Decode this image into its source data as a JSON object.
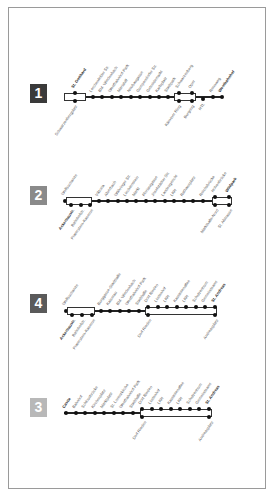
{
  "diagram": {
    "type": "route-line-diagram",
    "lines": [
      {
        "number": "1",
        "badge_color": "#3a3a3a",
        "terminus_start": "St. Gotthard",
        "terminus_end": "Westbahnhof",
        "stops_above": [
          "St. Gotthard",
          "Lerchenfelder Str.",
          "Bhf. Wiedenbach",
          "Westbahnhof-Park",
          "Mariahilf",
          "Neubaugasse",
          "Gumpendorfer Str.",
          "Getreidemarkt",
          "Karlsplatz",
          "Stadtpark",
          "Schwarzenberg",
          "Oper",
          "Rennweg",
          "Westbahnhof"
        ],
        "stops_below": [
          "Schwarzenbergplatz",
          "Kärntner Ring",
          "Burgring",
          "HTL"
        ]
      },
      {
        "number": "2",
        "badge_color": "#8a8a8a",
        "terminus_start": "Ackerbaustr.",
        "terminus_end": "Wildpark",
        "stops_above": [
          "Wolfsschanze",
          "Viktoria",
          "Alserbach",
          "Währinger Str.",
          "Liechtenstein",
          "Markt",
          "Florianigasse",
          "Josefstädter Str.",
          "Landesgericht",
          "LKH",
          "Rathausplatz",
          "LKH",
          "Reichsbrücke",
          "Hohenbrücke",
          "Wildpark"
        ],
        "stops_below": [
          "Ackerbaustr.",
          "Bahnhofstr.",
          "Praterstern-Kaserne",
          "Markthalle-Nord",
          "St. Alstrasse"
        ]
      },
      {
        "number": "4",
        "badge_color": "#5a5a5a",
        "terminus_start": "Ackerbaustr.",
        "terminus_end": "St. Andreas",
        "stops_above": [
          "Wolfsschanze",
          "Burggasse-Stadthalle",
          "Kaiserau",
          "Bhf. Wiedenbach",
          "Westbahnhof-Park",
          "Stadthalle",
          "Dorf Rieden",
          "Lindenhof",
          "LKH",
          "Kastanienallee",
          "LKH",
          "Schulzentrum",
          "Gemeindeamt",
          "St. Andreas"
        ],
        "stops_below": [
          "Ackerbaustr.",
          "Bahnhofstr.",
          "Praterstern-Kaserne",
          "Dorf Rieden",
          "Andreasplatz"
        ]
      },
      {
        "number": "3",
        "badge_color": "#b8b8b8",
        "terminus_start": "Castle",
        "terminus_end": "St. Andreas",
        "stops_above": [
          "Castle",
          "Bahnhof",
          "Schlossbrücke",
          "Kirchenplatz",
          "Marktplatz",
          "St. Lorenzkirche",
          "Westbahnhof-Park",
          "Stadthalle",
          "Dorf Rieden",
          "Lindenhof",
          "LKH",
          "Kastanienallee",
          "LKH",
          "Schulzentrum",
          "Gemeindeamt",
          "St. Andreas"
        ],
        "stops_below": [
          "Dorf Rieden",
          "Andreasplatz"
        ]
      }
    ],
    "colors": {
      "frame_border": "#9a9a9a",
      "track": "#222222",
      "stop": "#111111",
      "label": "#555555"
    }
  }
}
